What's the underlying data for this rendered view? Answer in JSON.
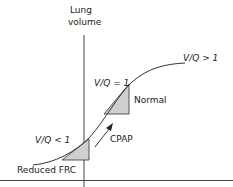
{
  "diagram": {
    "y_axis_label_line1": "Lung",
    "y_axis_label_line2": "volume",
    "labels": {
      "vq_high": "V/Q > 1",
      "vq_equal": "V/Q = 1",
      "vq_low": "V/Q < 1",
      "normal": "Normal",
      "cpap": "CPAP",
      "reduced_frc": "Reduced FRC"
    },
    "colors": {
      "line": "#333333",
      "shade": "#cccccc"
    }
  }
}
